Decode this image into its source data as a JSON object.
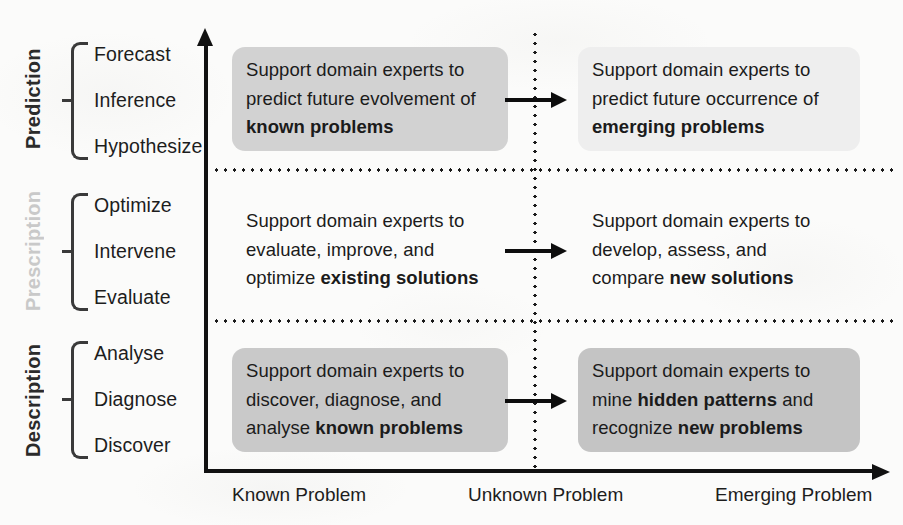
{
  "diagram": {
    "y_axis": {
      "name": "analysis-goal-axis",
      "groups": [
        {
          "label": "Prediction",
          "tone": "dark",
          "items": [
            "Forecast",
            "Inference",
            "Hypothesize"
          ]
        },
        {
          "label": "Prescription",
          "tone": "faded",
          "items": [
            "Optimize",
            "Intervene",
            "Evaluate"
          ]
        },
        {
          "label": "Description",
          "tone": "dark",
          "items": [
            "Analyse",
            "Diagnose",
            "Discover"
          ]
        }
      ]
    },
    "x_axis": {
      "name": "problem-type-axis",
      "labels": [
        "Known Problem",
        "Unknown Problem",
        "Emerging Problem"
      ]
    },
    "cells": [
      {
        "id": "prediction-known",
        "row": "Prediction",
        "column": "Known Problem",
        "fill": "#d2d2d2",
        "lines": [
          [
            {
              "t": "Support domain experts to",
              "b": false
            }
          ],
          [
            {
              "t": "predict future evolvement of",
              "b": false
            }
          ],
          [
            {
              "t": "known problems",
              "b": true
            }
          ]
        ]
      },
      {
        "id": "prediction-emerging",
        "row": "Prediction",
        "column": "Emerging Problem",
        "fill": "#eeeeee",
        "lines": [
          [
            {
              "t": "Support domain experts to",
              "b": false
            }
          ],
          [
            {
              "t": "predict future occurrence of",
              "b": false
            }
          ],
          [
            {
              "t": "emerging problems",
              "b": true
            }
          ]
        ]
      },
      {
        "id": "prescription-known",
        "row": "Prescription",
        "column": "Known Problem",
        "fill": "transparent",
        "lines": [
          [
            {
              "t": "Support domain experts to",
              "b": false
            }
          ],
          [
            {
              "t": "evaluate, improve, and",
              "b": false
            }
          ],
          [
            {
              "t": "optimize ",
              "b": false
            },
            {
              "t": "existing solutions",
              "b": true
            }
          ]
        ]
      },
      {
        "id": "prescription-emerging",
        "row": "Prescription",
        "column": "Emerging Problem",
        "fill": "transparent",
        "lines": [
          [
            {
              "t": "Support domain experts to",
              "b": false
            }
          ],
          [
            {
              "t": "develop, assess, and",
              "b": false
            }
          ],
          [
            {
              "t": "compare ",
              "b": false
            },
            {
              "t": "new solutions",
              "b": true
            }
          ]
        ]
      },
      {
        "id": "description-known",
        "row": "Description",
        "column": "Known Problem",
        "fill": "#c9c9c9",
        "lines": [
          [
            {
              "t": "Support domain experts to",
              "b": false
            }
          ],
          [
            {
              "t": "discover, diagnose, and",
              "b": false
            }
          ],
          [
            {
              "t": "analyse ",
              "b": false
            },
            {
              "t": "known problems",
              "b": true
            }
          ]
        ]
      },
      {
        "id": "description-emerging",
        "row": "Description",
        "column": "Emerging Problem",
        "fill": "#c4c4c4",
        "lines": [
          [
            {
              "t": "Support domain experts to",
              "b": false
            }
          ],
          [
            {
              "t": "mine ",
              "b": false
            },
            {
              "t": "hidden patterns",
              "b": true
            },
            {
              "t": " and",
              "b": false
            }
          ],
          [
            {
              "t": "recognize ",
              "b": false
            },
            {
              "t": "new problems",
              "b": true
            }
          ]
        ]
      }
    ],
    "flow_arrows": [
      {
        "id": "arrow-prediction-row"
      },
      {
        "id": "arrow-prescription-row"
      },
      {
        "id": "arrow-description-row"
      }
    ]
  }
}
